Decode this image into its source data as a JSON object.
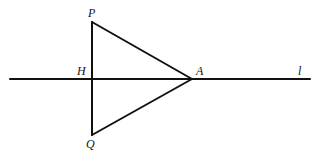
{
  "diagram": {
    "type": "geometry",
    "stroke_color": "#111111",
    "background": "#ffffff",
    "points": {
      "P": {
        "label": "P",
        "x": 92,
        "y": 22
      },
      "Q": {
        "label": "Q",
        "x": 92,
        "y": 135
      },
      "H": {
        "label": "H",
        "x": 92,
        "y": 79
      },
      "A": {
        "label": "A",
        "x": 192,
        "y": 79
      }
    },
    "line_l": {
      "label": "l",
      "x1": 10,
      "y1": 79,
      "x2": 310,
      "y2": 79
    },
    "segments": [
      {
        "from": "P",
        "to": "Q"
      },
      {
        "from": "P",
        "to": "A"
      },
      {
        "from": "Q",
        "to": "A"
      }
    ]
  }
}
